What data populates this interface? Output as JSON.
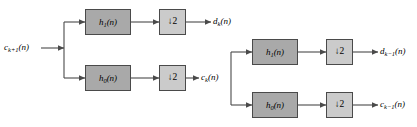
{
  "diagram": {
    "type": "signal-flow-block-diagram",
    "colors": {
      "filter_block_fill": "#a9a9a9",
      "downsampler_block_fill": "#cbcbcb",
      "block_border": "#4a4a4a",
      "wire": "#4a4a4a",
      "background": "#ffffff",
      "text": "#000000"
    },
    "signals": {
      "input": {
        "base": "c",
        "subscript": "k+1",
        "arg": "(n)",
        "text": "c k+1 (n)"
      },
      "intermediate": {
        "base": "c",
        "subscript": "k",
        "arg": "(n)",
        "text": "c k (n)"
      },
      "output_detail_stage1": {
        "base": "d",
        "subscript": "k",
        "arg": "(n)",
        "text": "d k (n)"
      },
      "output_detail_stage2": {
        "base": "d",
        "subscript": "k-1",
        "arg": "(n)",
        "text": "d k-1 (n)"
      },
      "output_approx_stage2": {
        "base": "c",
        "subscript": "k-1",
        "arg": "(n)",
        "text": "c k-1 (n)"
      }
    },
    "blocks": {
      "highpass_stage1": {
        "base": "h",
        "subscript": "1",
        "arg": "(n)",
        "text": "h 1 (n)"
      },
      "lowpass_stage1": {
        "base": "h",
        "subscript": "0",
        "arg": "(n)",
        "text": "h 0 (n)"
      },
      "highpass_stage2": {
        "base": "h",
        "subscript": "1",
        "arg": "(n)",
        "text": "h 1 (n)"
      },
      "lowpass_stage2": {
        "base": "h",
        "subscript": "0",
        "arg": "(n)",
        "text": "h 0 (n)"
      },
      "downsampler_1": {
        "label": "↓2"
      },
      "downsampler_2": {
        "label": "↓2"
      },
      "downsampler_3": {
        "label": "↓2"
      },
      "downsampler_4": {
        "label": "↓2"
      }
    }
  }
}
